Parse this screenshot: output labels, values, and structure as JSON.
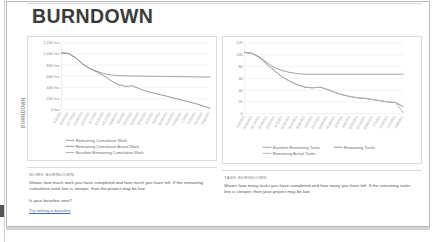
{
  "page": {
    "title": "BURNDOWN",
    "side_label": "BURNDOWN"
  },
  "left_panel": {
    "section_heading": "WORK BURNDOWN",
    "description": "Shows how much work you have completed and how much you have left. If the remaining cumulative work line is steeper, then the project may be late",
    "question": "Is your baseline zero?",
    "link": "Try setting a baseline"
  },
  "right_panel": {
    "section_heading": "TASK BURNDOWN",
    "description": "Shows how many tasks you have completed and how many you have left. If the remaining tasks line is steeper, then your project may be late"
  },
  "chart_data": [
    {
      "id": "work-burndown",
      "type": "line",
      "title": "",
      "xlabel": "",
      "ylabel": "",
      "ylim": [
        0,
        1200
      ],
      "yticks": [
        0,
        200,
        400,
        600,
        800,
        1000,
        1200
      ],
      "ytick_labels": [
        "0 hrs",
        "200 hrs",
        "400 hrs",
        "600 hrs",
        "800 hrs",
        "1,000 hrs",
        "1,200 hrs"
      ],
      "grid": true,
      "legend_position": "bottom",
      "categories": [
        "3/3/2012",
        "3/10/2012",
        "3/17/2012",
        "3/24/2012",
        "3/31/2012",
        "4/7/2012",
        "4/14/2012",
        "4/21/2012",
        "4/28/2012",
        "5/5/2012",
        "5/12/2012",
        "5/19/2012",
        "5/26/2012",
        "6/2/2012",
        "6/9/2012",
        "6/16/2012",
        "6/23/2012",
        "6/30/2012",
        "7/7/2012",
        "7/14/2012",
        "7/21/2012",
        "7/28/2012"
      ],
      "series": [
        {
          "name": "Remaining Cumulative Work",
          "color": "#9a9a9a",
          "values": [
            1020,
            1010,
            930,
            820,
            740,
            690,
            650,
            625,
            615,
            610,
            607,
            605,
            603,
            601,
            600,
            598,
            596,
            594,
            592,
            590,
            588,
            586
          ]
        },
        {
          "name": "Remaining Cumulative Actual Work",
          "color": "#8a8a8a",
          "values": [
            1020,
            1010,
            930,
            820,
            740,
            680,
            610,
            520,
            455,
            420,
            430,
            380,
            330,
            300,
            270,
            240,
            205,
            175,
            140,
            110,
            70,
            30
          ]
        },
        {
          "name": "Baseline Remaining Cumulative Work",
          "color": "#b0b0b0",
          "values": [
            0,
            0,
            0,
            0,
            0,
            0,
            0,
            0,
            0,
            0,
            0,
            0,
            0,
            0,
            0,
            0,
            0,
            0,
            0,
            0,
            0,
            0
          ]
        }
      ]
    },
    {
      "id": "task-burndown",
      "type": "line",
      "title": "",
      "xlabel": "",
      "ylabel": "",
      "ylim": [
        0,
        120
      ],
      "yticks": [
        0,
        20,
        40,
        60,
        80,
        100,
        120
      ],
      "ytick_labels": [
        "0",
        "20",
        "40",
        "60",
        "80",
        "100",
        "120"
      ],
      "grid": true,
      "legend_position": "bottom",
      "categories": [
        "3/3/2012",
        "3/10/2012",
        "3/17/2012",
        "3/24/2012",
        "3/31/2012",
        "4/7/2012",
        "4/14/2012",
        "4/21/2012",
        "4/28/2012",
        "5/5/2012",
        "5/12/2012",
        "5/19/2012",
        "5/26/2012",
        "6/2/2012",
        "6/9/2012",
        "6/16/2012",
        "6/23/2012",
        "6/30/2012",
        "7/7/2012",
        "7/14/2012",
        "7/21/2012",
        "7/28/2012"
      ],
      "series": [
        {
          "name": "Baseline Remaining Tasks",
          "color": "#9a9a9a",
          "values": [
            104,
            102,
            96,
            86,
            78,
            73,
            70,
            68,
            67,
            67,
            67,
            67,
            67,
            67,
            67,
            67,
            67,
            67,
            67,
            67,
            67,
            67
          ]
        },
        {
          "name": "Remaining Tasks",
          "color": "#8a8a8a",
          "values": [
            104,
            102,
            95,
            83,
            72,
            62,
            55,
            49,
            45,
            44,
            45,
            41,
            36,
            32,
            29,
            27,
            26,
            24,
            22,
            20,
            19,
            12
          ]
        },
        {
          "name": "Remaining Actual Tasks",
          "color": "#b0b0b0",
          "values": [
            104,
            102,
            95,
            83,
            72,
            62,
            55,
            49,
            45,
            44,
            45,
            41,
            36,
            32,
            29,
            27,
            26,
            24,
            22,
            20,
            19,
            2
          ]
        }
      ]
    }
  ]
}
